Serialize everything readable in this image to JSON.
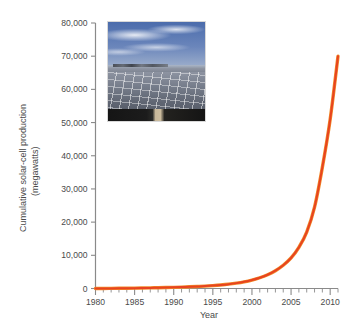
{
  "chart_data": {
    "type": "line",
    "title": "",
    "xlabel": "Year",
    "ylabel": "Cumulative solar-cell production (megawatts)",
    "ylabel_line1": "Cumulative solar-cell production",
    "ylabel_line2": "(megawatts)",
    "xlim": [
      1980,
      2011
    ],
    "ylim": [
      0,
      80000
    ],
    "grid": false,
    "legend": "none",
    "x_major_ticks": [
      1980,
      1985,
      1990,
      1995,
      2000,
      2005,
      2010
    ],
    "x_major_tick_labels": [
      "1980",
      "1985",
      "1990",
      "1995",
      "2000",
      "2005",
      "2010"
    ],
    "x_minor_tick_step": 1,
    "y_ticks": [
      0,
      10000,
      20000,
      30000,
      40000,
      50000,
      60000,
      70000,
      80000
    ],
    "y_tick_labels": [
      "0",
      "10,000",
      "20,000",
      "30,000",
      "40,000",
      "50,000",
      "60,000",
      "70,000",
      "80,000"
    ],
    "series": [
      {
        "name": "Cumulative solar-cell production",
        "color": "#e8431f",
        "x": [
          1980,
          1981,
          1982,
          1983,
          1984,
          1985,
          1986,
          1987,
          1988,
          1989,
          1990,
          1991,
          1992,
          1993,
          1994,
          1995,
          1996,
          1997,
          1998,
          1999,
          2000,
          2001,
          2002,
          2003,
          2004,
          2005,
          2006,
          2007,
          2008,
          2009,
          2010,
          2011
        ],
        "values": [
          10,
          20,
          35,
          55,
          80,
          110,
          145,
          185,
          230,
          285,
          350,
          425,
          510,
          610,
          730,
          880,
          1070,
          1310,
          1620,
          2020,
          2550,
          3240,
          4150,
          5360,
          7000,
          9200,
          12400,
          17000,
          24500,
          36500,
          51000,
          70000
        ]
      }
    ],
    "annotations": []
  },
  "inset_photo": {
    "name": "solar-farm-photograph",
    "description": "Aerial view of a large solar photovoltaic panel farm under a blue sky with scattered clouds",
    "sky_color": "#5f7bb0",
    "panel_color": "#6f7685"
  }
}
